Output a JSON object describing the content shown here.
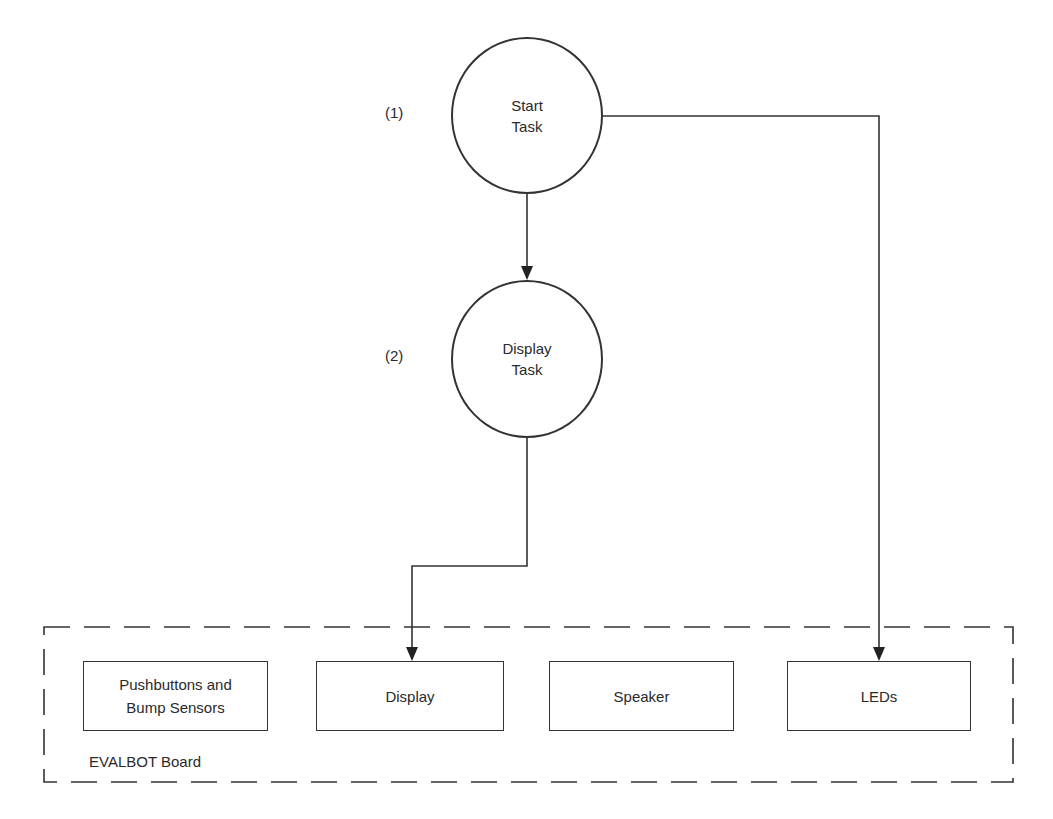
{
  "diagram": {
    "tasks": [
      {
        "number": "(1)",
        "label": "Start\nTask"
      },
      {
        "number": "(2)",
        "label": "Display\nTask"
      }
    ],
    "board": {
      "label": "EVALBOT Board",
      "components": [
        {
          "label": "Pushbuttons and\nBump Sensors"
        },
        {
          "label": "Display"
        },
        {
          "label": "Speaker"
        },
        {
          "label": "LEDs"
        }
      ]
    },
    "edges": [
      {
        "from": "Start Task",
        "to": "Display Task"
      },
      {
        "from": "Start Task",
        "to": "LEDs"
      },
      {
        "from": "Display Task",
        "to": "Display"
      }
    ],
    "colors": {
      "line": "#333333",
      "background": "#ffffff"
    }
  }
}
